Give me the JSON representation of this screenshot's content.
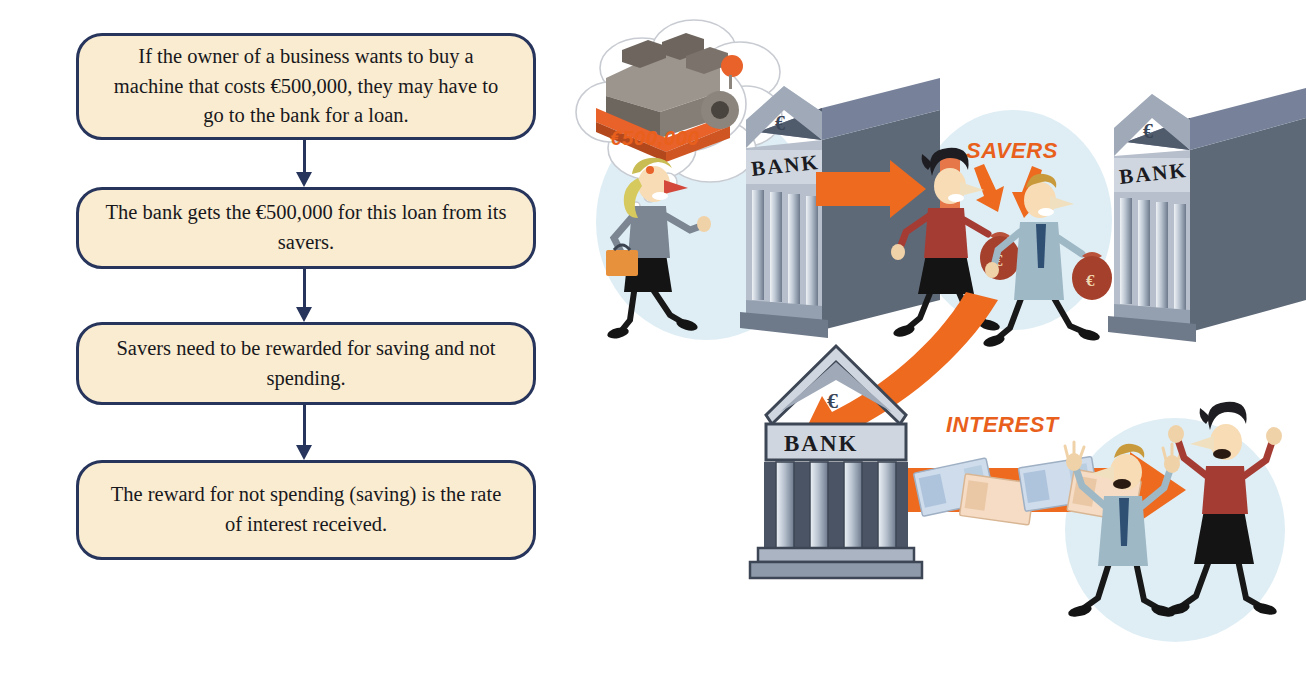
{
  "flowchart": {
    "steps": [
      {
        "id": "step-1",
        "text": "If the owner of a business wants to buy a machine that costs €500,000, they may have to go to the bank for a loan."
      },
      {
        "id": "step-2",
        "text": "The bank gets the €500,000 for this loan from its savers."
      },
      {
        "id": "step-3",
        "text": "Savers need to be rewarded for saving and not spending."
      },
      {
        "id": "step-4",
        "text": "The reward for not spending (saving) is the rate of interest received."
      }
    ],
    "box_fill": "#faecd0",
    "box_border": "#27355c",
    "connector_color": "#27355c"
  },
  "illustration": {
    "thought_amount": "€500,000",
    "savers_label": "SAVERS",
    "interest_label": "INTEREST",
    "bank_sign_top_right": "BANK",
    "bank_sign_left": "BANK",
    "bank_sign_bottom": "BANK",
    "euro_symbol": "€",
    "accent_orange": "#ed6a1f",
    "circle_blue": "#dfeef5",
    "bank_grey": "#8a95a6",
    "bank_dark": "#545f72"
  }
}
